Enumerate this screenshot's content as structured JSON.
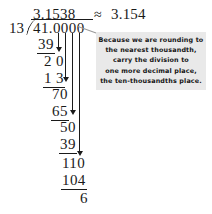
{
  "problem": {
    "quotient": "3.1538",
    "approx_symbol": "≈",
    "rounded_value": "3.154",
    "divisor": "13",
    "dividend": "41.0000"
  },
  "steps": [
    {
      "value": "39",
      "underlined": true
    },
    {
      "value": "2 0",
      "underlined": false
    },
    {
      "value": "1 3",
      "underlined": true
    },
    {
      "value": "70",
      "underlined": false
    },
    {
      "value": "65",
      "underlined": true
    },
    {
      "value": "50",
      "underlined": false
    },
    {
      "value": "39",
      "underlined": true
    },
    {
      "value": "110",
      "underlined": false
    },
    {
      "value": "104",
      "underlined": true
    },
    {
      "value": "6",
      "underlined": false
    }
  ],
  "callout": {
    "lines": [
      "Because we are rounding to",
      "the nearest thousandth,",
      "carry the division to",
      "one more decimal place,",
      "the ten-thousandths place."
    ]
  },
  "colors": {
    "ink": "#1a1a1a",
    "callout_background": "#e9e9e9",
    "page_background": "#ffffff"
  }
}
